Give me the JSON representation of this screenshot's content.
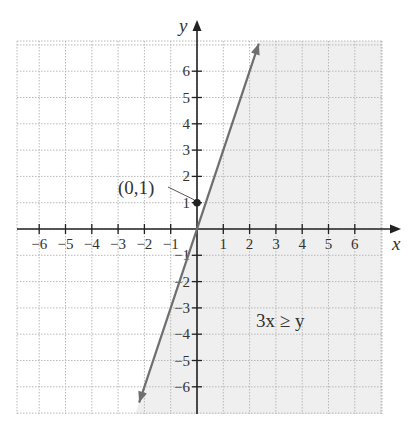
{
  "chart_data": {
    "type": "inequality-graph",
    "title": "",
    "inequality": "3x ≥ y",
    "boundary_line": {
      "equation": "y = 3x",
      "style": "solid",
      "from": [
        -2.2,
        -6.6
      ],
      "to": [
        2.35,
        7.05
      ]
    },
    "shaded_region": "right/below boundary (3x ≥ y)",
    "labeled_point": {
      "label": "(0, 1)",
      "x": 0,
      "y": 1
    },
    "xlabel": "x",
    "ylabel": "y",
    "xlim": [
      -7,
      7
    ],
    "ylim": [
      -7,
      7
    ],
    "x_ticks": [
      -6,
      -5,
      -4,
      -3,
      -2,
      -1,
      1,
      2,
      3,
      4,
      5,
      6
    ],
    "y_ticks": [
      6,
      5,
      4,
      3,
      2,
      1,
      -1,
      -2,
      -3,
      -4,
      -5,
      -6
    ],
    "grid": true,
    "grid_style": "dotted"
  },
  "labels": {
    "x_axis": "x",
    "y_axis": "y",
    "inequality": "3x ≥ y",
    "point": "(0,1)"
  },
  "colors": {
    "shade": "#efefef",
    "grid": "#b8b8b8",
    "axis": "#222222",
    "boundary": "#6e6e6e"
  }
}
